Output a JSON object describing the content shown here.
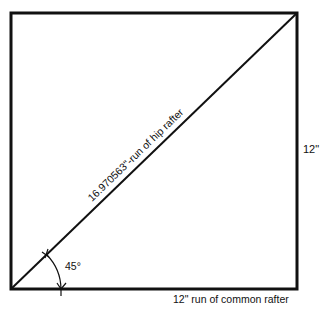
{
  "diagram": {
    "hypotenuse_label": "16.970563\"-run of hip rafter",
    "angle_label": "45°",
    "right_side_label": "12\"",
    "bottom_label": "12\" run of common rafter",
    "line_color": "#111111"
  }
}
